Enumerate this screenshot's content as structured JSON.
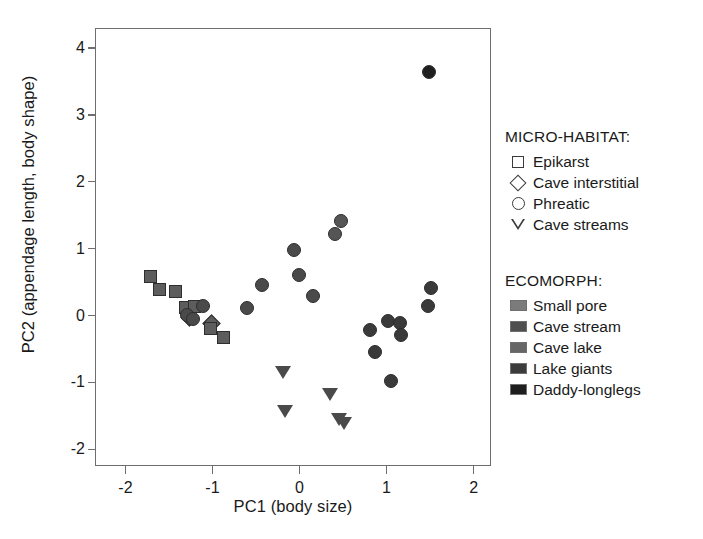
{
  "chart_data": {
    "type": "scatter",
    "title": "",
    "xlabel": "PC1 (body size)",
    "ylabel": "PC2 (appendage length, body shape)",
    "xlim": [
      -2.35,
      2.2
    ],
    "ylim": [
      -2.25,
      4.3
    ],
    "xticks": [
      -2,
      -1,
      0,
      1,
      2
    ],
    "xticklabels": [
      "-2",
      "-1",
      "0",
      "1",
      "2"
    ],
    "yticks": [
      -2,
      -1,
      0,
      1,
      2,
      3,
      4
    ],
    "yticklabels": [
      "-2",
      "-1",
      "0",
      "1",
      "2",
      "3",
      "4"
    ],
    "grid": false,
    "legend_position": "right",
    "marker_shape_meaning": "micro-habitat",
    "marker_fill_meaning": "ecomorph",
    "points": [
      {
        "x": -1.72,
        "y": 0.6,
        "shape": "square",
        "ecomorph": "Small pore"
      },
      {
        "x": -1.62,
        "y": 0.4,
        "shape": "square",
        "ecomorph": "Small pore"
      },
      {
        "x": -1.44,
        "y": 0.38,
        "shape": "square",
        "ecomorph": "Small pore"
      },
      {
        "x": -1.32,
        "y": 0.14,
        "shape": "square",
        "ecomorph": "Small pore"
      },
      {
        "x": -1.22,
        "y": 0.15,
        "shape": "square",
        "ecomorph": "Small pore"
      },
      {
        "x": -1.28,
        "y": -0.02,
        "shape": "diamond",
        "ecomorph": "Small pore"
      },
      {
        "x": -1.02,
        "y": -0.1,
        "shape": "diamond",
        "ecomorph": "Small pore"
      },
      {
        "x": -1.04,
        "y": -0.18,
        "shape": "square",
        "ecomorph": "Small pore"
      },
      {
        "x": -0.88,
        "y": -0.32,
        "shape": "square",
        "ecomorph": "Small pore"
      },
      {
        "x": -1.3,
        "y": 0.02,
        "shape": "circle",
        "ecomorph": "Cave stream"
      },
      {
        "x": -1.24,
        "y": -0.04,
        "shape": "circle",
        "ecomorph": "Cave stream"
      },
      {
        "x": -1.12,
        "y": 0.16,
        "shape": "circle",
        "ecomorph": "Cave stream"
      },
      {
        "x": -0.62,
        "y": 0.13,
        "shape": "circle",
        "ecomorph": "Cave stream"
      },
      {
        "x": -0.44,
        "y": 0.47,
        "shape": "circle",
        "ecomorph": "Cave stream"
      },
      {
        "x": -0.02,
        "y": 0.62,
        "shape": "circle",
        "ecomorph": "Cave stream"
      },
      {
        "x": -0.08,
        "y": 0.99,
        "shape": "circle",
        "ecomorph": "Cave stream"
      },
      {
        "x": 0.14,
        "y": 0.31,
        "shape": "circle",
        "ecomorph": "Cave stream"
      },
      {
        "x": 0.4,
        "y": 1.24,
        "shape": "circle",
        "ecomorph": "Cave lake"
      },
      {
        "x": 0.46,
        "y": 1.43,
        "shape": "circle",
        "ecomorph": "Cave lake"
      },
      {
        "x": -0.2,
        "y": -0.82,
        "shape": "triangle",
        "ecomorph": "Cave stream"
      },
      {
        "x": -0.18,
        "y": -1.4,
        "shape": "triangle",
        "ecomorph": "Cave stream"
      },
      {
        "x": 0.34,
        "y": -1.15,
        "shape": "triangle",
        "ecomorph": "Cave stream"
      },
      {
        "x": 0.44,
        "y": -1.52,
        "shape": "triangle",
        "ecomorph": "Cave stream"
      },
      {
        "x": 0.5,
        "y": -1.58,
        "shape": "triangle",
        "ecomorph": "Cave stream"
      },
      {
        "x": 0.8,
        "y": -0.2,
        "shape": "circle",
        "ecomorph": "Lake giants"
      },
      {
        "x": 0.86,
        "y": -0.53,
        "shape": "circle",
        "ecomorph": "Lake giants"
      },
      {
        "x": 1.0,
        "y": -0.06,
        "shape": "circle",
        "ecomorph": "Lake giants"
      },
      {
        "x": 1.04,
        "y": -0.97,
        "shape": "circle",
        "ecomorph": "Lake giants"
      },
      {
        "x": 1.14,
        "y": -0.09,
        "shape": "circle",
        "ecomorph": "Lake giants"
      },
      {
        "x": 1.16,
        "y": -0.28,
        "shape": "circle",
        "ecomorph": "Lake giants"
      },
      {
        "x": 1.46,
        "y": 0.16,
        "shape": "circle",
        "ecomorph": "Lake giants"
      },
      {
        "x": 1.5,
        "y": 0.42,
        "shape": "circle",
        "ecomorph": "Lake giants"
      },
      {
        "x": 1.48,
        "y": 3.66,
        "shape": "circle",
        "ecomorph": "Daddy-longlegs"
      }
    ]
  },
  "ecomorph_colors": {
    "Small pore": "#5d5d5d",
    "Cave stream": "#4a4a4a",
    "Cave lake": "#555555",
    "Lake giants": "#3a3a3a",
    "Daddy-longlegs": "#1f1f1f"
  },
  "legends": [
    {
      "title": "MICRO-HABITAT:",
      "entries": [
        {
          "key": "square-marker-icon",
          "label": "Epikarst"
        },
        {
          "key": "diamond-marker-icon",
          "label": "Cave interstitial"
        },
        {
          "key": "circle-marker-icon",
          "label": "Phreatic"
        },
        {
          "key": "triangle-marker-icon",
          "label": "Cave streams"
        }
      ]
    },
    {
      "title": "ECOMORPH:",
      "entries": [
        {
          "key": "swatch-icon",
          "label": "Small pore",
          "color": "#7b7b7b"
        },
        {
          "key": "swatch-icon",
          "label": "Cave stream",
          "color": "#4f4f4f"
        },
        {
          "key": "swatch-icon",
          "label": "Cave lake",
          "color": "#666666"
        },
        {
          "key": "swatch-icon",
          "label": "Lake giants",
          "color": "#3c3c3c"
        },
        {
          "key": "swatch-icon",
          "label": "Daddy-longlegs",
          "color": "#1e1e1e"
        }
      ]
    }
  ]
}
